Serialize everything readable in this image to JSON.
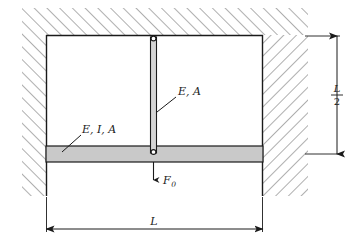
{
  "figure": {
    "kind": "structural-mechanics-diagram",
    "title": "",
    "colors": {
      "line": "#1a1a1a",
      "hatch": "#6b6b6b",
      "beam_fill": "#c9c9c9",
      "bar_fill": "#d4d4d4",
      "background": "#ffffff"
    },
    "labels": {
      "column_material": "E, A",
      "column_material_parts": {
        "modulus": "E",
        "area": "A"
      },
      "beam_material": "E, I, A",
      "beam_material_parts": {
        "modulus": "E",
        "inertia": "I",
        "area": "A"
      },
      "force": "F",
      "force_subscript": "0",
      "force_full": "F0",
      "height_dim_numerator": "L",
      "height_dim_denominator": "2",
      "height_dim_full": "L/2",
      "width_dim": "L"
    },
    "geometry": {
      "span_width_symbol": "L",
      "column_height_symbol": "L/2",
      "left_support": "fixed-wall",
      "right_support": "fixed-wall",
      "column_top_joint": "pin",
      "column_bottom_joint": "pin",
      "load_direction": "downward",
      "load_location": "beam-midspan"
    }
  }
}
